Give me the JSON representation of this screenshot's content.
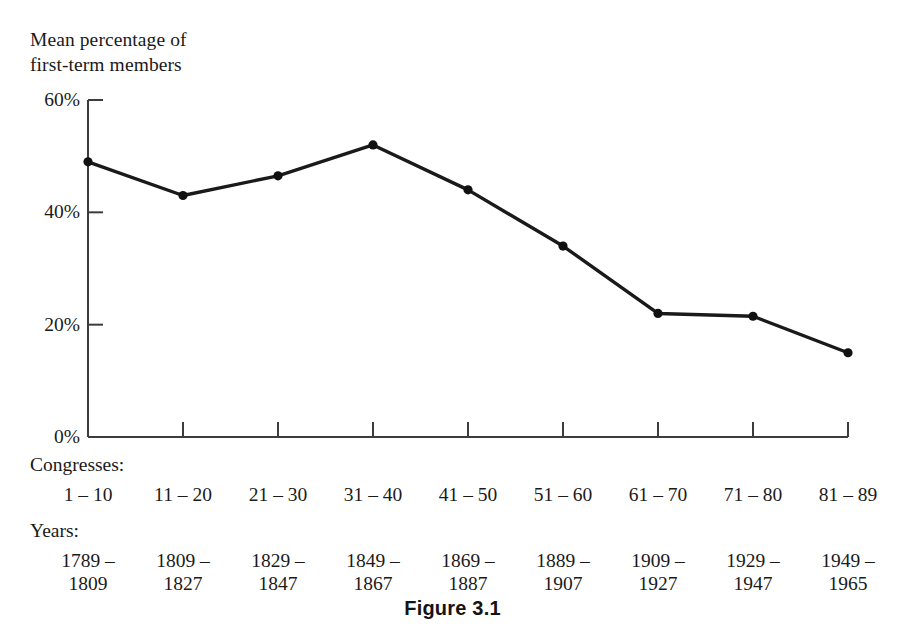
{
  "axis_title": "Mean percentage of\nfirst-term members",
  "caption": "Figure 3.1",
  "congresses_heading": "Congresses:",
  "years_heading": "Years:",
  "colors": {
    "line": "#1a1a1a",
    "marker": "#111111",
    "axis": "#3c3c3c",
    "text": "#1a1a1a",
    "background": "#ffffff"
  },
  "chart_data": {
    "type": "line",
    "title": "Figure 3.1",
    "xlabel": "Congresses / Years",
    "ylabel": "Mean percentage of first-term members",
    "ylim": [
      0,
      60
    ],
    "yticks": [
      0,
      20,
      40,
      60
    ],
    "ytick_labels": [
      "0%",
      "20%",
      "40%",
      "60%"
    ],
    "grid": false,
    "legend": "none",
    "categories": [
      "1 – 10",
      "11 – 20",
      "21 – 30",
      "31 – 40",
      "41 – 50",
      "51 – 60",
      "61 – 70",
      "71 – 80",
      "81 – 89"
    ],
    "years": [
      "1789 – 1809",
      "1809 – 1827",
      "1829 – 1847",
      "1849 – 1867",
      "1869 – 1887",
      "1889 – 1907",
      "1909 – 1927",
      "1929 – 1947",
      "1949 – 1965"
    ],
    "values": [
      49,
      43,
      46.5,
      52,
      44,
      34,
      22,
      21.5,
      15
    ],
    "series": [
      {
        "name": "Mean percentage of first-term members",
        "values": [
          49,
          43,
          46.5,
          52,
          44,
          34,
          22,
          21.5,
          15
        ]
      }
    ]
  },
  "columns": [
    {
      "congress": "1 – 10",
      "year_start": "1789 –",
      "year_end": "1809"
    },
    {
      "congress": "11 – 20",
      "year_start": "1809 –",
      "year_end": "1827"
    },
    {
      "congress": "21 – 30",
      "year_start": "1829 –",
      "year_end": "1847"
    },
    {
      "congress": "31 – 40",
      "year_start": "1849 –",
      "year_end": "1867"
    },
    {
      "congress": "41 – 50",
      "year_start": "1869 –",
      "year_end": "1887"
    },
    {
      "congress": "51 – 60",
      "year_start": "1889 –",
      "year_end": "1907"
    },
    {
      "congress": "61 – 70",
      "year_start": "1909 –",
      "year_end": "1927"
    },
    {
      "congress": "71 – 80",
      "year_start": "1929 –",
      "year_end": "1947"
    },
    {
      "congress": "81 – 89",
      "year_start": "1949 –",
      "year_end": "1965"
    }
  ]
}
